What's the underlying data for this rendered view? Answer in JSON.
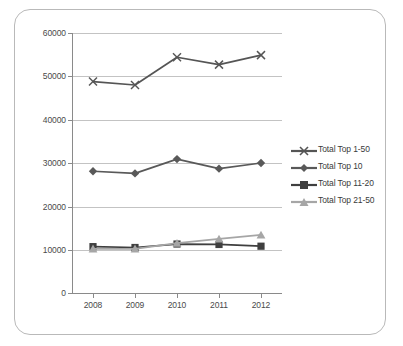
{
  "chart_data": {
    "type": "line",
    "title": "",
    "subtitle": "",
    "xlabel": "",
    "ylabel": "",
    "categories": [
      "2008",
      "2009",
      "2010",
      "2011",
      "2012"
    ],
    "x": [
      2008,
      2009,
      2010,
      2011,
      2012
    ],
    "ylim": [
      0,
      60000
    ],
    "yticks": [
      0,
      10000,
      20000,
      30000,
      40000,
      50000,
      60000
    ],
    "ytick_labels": [
      "0",
      "10000",
      "20000",
      "30000",
      "40000",
      "50000",
      "60000"
    ],
    "grid": "horizontal",
    "legend_position": "right",
    "series": [
      {
        "name": "Total Top 1-50",
        "marker": "x",
        "color": "#555555",
        "values": [
          48800,
          48000,
          54400,
          52700,
          54900
        ]
      },
      {
        "name": "Total Top 10",
        "marker": "diamond",
        "color": "#595959",
        "values": [
          28100,
          27600,
          30900,
          28700,
          30000
        ]
      },
      {
        "name": "Total Top 11-20",
        "marker": "square",
        "color": "#3f3f3f",
        "values": [
          10700,
          10500,
          11300,
          11200,
          10800
        ]
      },
      {
        "name": "Total Top 21-50",
        "marker": "triangle",
        "color": "#a6a6a6",
        "values": [
          10200,
          10200,
          11500,
          12500,
          13400
        ]
      }
    ]
  },
  "axis": {
    "y_labels": [
      "60000",
      "50000",
      "40000",
      "30000",
      "20000",
      "10000",
      "0"
    ],
    "x_labels": [
      "2008",
      "2009",
      "2010",
      "2011",
      "2012"
    ]
  },
  "legend": {
    "items": [
      {
        "label": "Total Top 1-50",
        "color": "#555555",
        "marker": "x"
      },
      {
        "label": "Total Top 10",
        "color": "#595959",
        "marker": "diamond"
      },
      {
        "label": "Total Top 11-20",
        "color": "#3f3f3f",
        "marker": "square"
      },
      {
        "label": "Total Top 21-50",
        "color": "#a6a6a6",
        "marker": "triangle"
      }
    ]
  },
  "colors": {
    "grid": "#c3c3c3",
    "axis": "#8a8a8a",
    "frame": "#b9b9b9",
    "text": "#3a3a3a",
    "background": "#ffffff"
  }
}
